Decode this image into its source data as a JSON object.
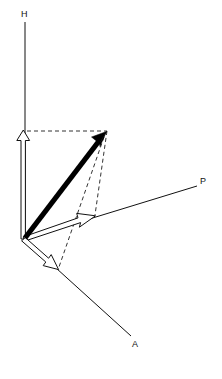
{
  "figure": {
    "width": 222,
    "height": 379,
    "background_color": "#ffffff",
    "ink_color": "#111111",
    "dash_color": "#333333",
    "resultant_color": "#000000"
  },
  "origin": {
    "x": 24,
    "y": 239,
    "label": ""
  },
  "axes": [
    {
      "id": "h-axis",
      "label": "H",
      "label_x": 21,
      "label_y": 17,
      "from": {
        "x": 25,
        "y": 239
      },
      "to": {
        "x": 25,
        "y": 22
      },
      "orientation": "vertical-up"
    },
    {
      "id": "p-axis",
      "label": "P",
      "label_x": 200,
      "label_y": 184,
      "from": {
        "x": 24,
        "y": 239
      },
      "to": {
        "x": 197,
        "y": 186
      },
      "orientation": "oblique-right-up"
    },
    {
      "id": "a-axis",
      "label": "A",
      "label_x": 132,
      "label_y": 347,
      "from": {
        "x": 24,
        "y": 239
      },
      "to": {
        "x": 131,
        "y": 336
      },
      "orientation": "oblique-right-down"
    }
  ],
  "resultant": {
    "id": "resultant-vector",
    "label": "",
    "from": {
      "x": 24,
      "y": 239
    },
    "to": {
      "x": 106,
      "y": 132
    },
    "style": "solid-thick-filled-arrow",
    "color": "#000000"
  },
  "components": [
    {
      "id": "h-component",
      "axis": "H",
      "label": "",
      "from": {
        "x": 23,
        "y": 239
      },
      "to": {
        "x": 23,
        "y": 130
      },
      "style": "hollow-outline-arrow"
    },
    {
      "id": "p-component",
      "axis": "P",
      "label": "",
      "from": {
        "x": 24,
        "y": 239
      },
      "to": {
        "x": 95,
        "y": 216
      },
      "style": "hollow-outline-arrow"
    },
    {
      "id": "a-component",
      "axis": "A",
      "label": "",
      "from": {
        "x": 24,
        "y": 239
      },
      "to": {
        "x": 58,
        "y": 269
      },
      "style": "hollow-outline-arrow"
    }
  ],
  "construction_lines": [
    {
      "id": "dashed-h-top-horizontal",
      "from": {
        "x": 27,
        "y": 131
      },
      "to": {
        "x": 107,
        "y": 131
      },
      "style": "dashed"
    },
    {
      "id": "dashed-tip-to-p-component",
      "from": {
        "x": 107,
        "y": 131
      },
      "to": {
        "x": 95,
        "y": 216
      },
      "style": "dashed"
    },
    {
      "id": "dashed-tip-to-a-component",
      "from": {
        "x": 104,
        "y": 137
      },
      "to": {
        "x": 58,
        "y": 268
      },
      "style": "dashed"
    }
  ]
}
